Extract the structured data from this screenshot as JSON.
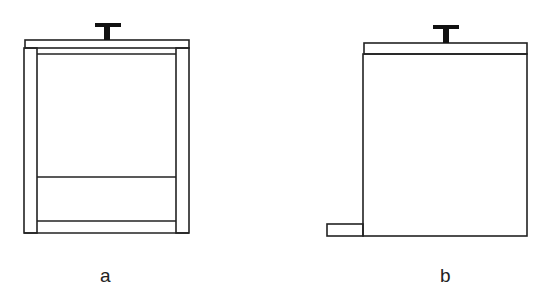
{
  "figures": [
    {
      "id": "a",
      "label": "a",
      "description": "container with lid, side walls, and bottom chamber"
    },
    {
      "id": "b",
      "label": "b",
      "description": "container with lid and side outlet tab at bottom left"
    }
  ],
  "colors": {
    "stroke": "#222222",
    "background": "#ffffff"
  }
}
